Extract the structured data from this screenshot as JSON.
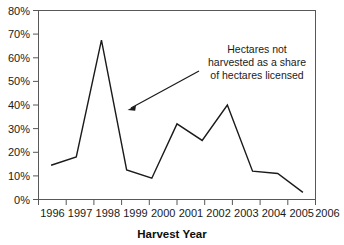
{
  "chart_data": {
    "type": "line",
    "title": "",
    "xlabel": "Harvest Year",
    "ylabel": "",
    "categories": [
      "1996",
      "1997",
      "1998",
      "1999",
      "2000",
      "2001",
      "2002",
      "2003",
      "2004",
      "2005",
      "2006"
    ],
    "values": [
      14.5,
      18,
      67.5,
      12.5,
      9,
      32,
      25,
      40,
      12,
      11,
      3
    ],
    "series": [
      {
        "name": "Hectares not harvested as a share of hectares licensed",
        "values": [
          14.5,
          18,
          67.5,
          12.5,
          9,
          32,
          25,
          40,
          12,
          11,
          3
        ]
      }
    ],
    "ylim": [
      0,
      80
    ],
    "ytick_values": [
      0,
      10,
      20,
      30,
      40,
      50,
      60,
      70,
      80
    ],
    "ytick_labels": [
      "0%",
      "10%",
      "20%",
      "30%",
      "40%",
      "50%",
      "60%",
      "70%",
      "80%"
    ],
    "grid": false,
    "legend": "none",
    "series_color": "#1a1a1a",
    "frame_color": "#58585a",
    "annotations": [
      {
        "lines": [
          "Hectares not",
          "harvested as a share",
          "of hectares licensed"
        ],
        "text": "Hectares not harvested as a share of hectares licensed",
        "arrow": "points to line between 1998 and 1999"
      }
    ]
  }
}
